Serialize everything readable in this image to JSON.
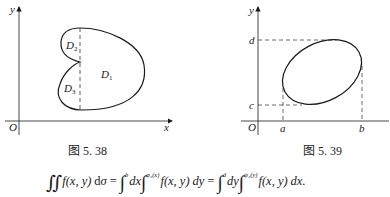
{
  "figures": [
    {
      "id": "fig-5-38",
      "caption": "图 5. 38",
      "axes": {
        "x_label": "x",
        "y_label": "y",
        "origin_label": "O"
      },
      "regions": [
        {
          "label": "D",
          "sub": "1"
        },
        {
          "label": "D",
          "sub": "2"
        },
        {
          "label": "D",
          "sub": "3"
        }
      ]
    },
    {
      "id": "fig-5-39",
      "caption": "图 5. 39",
      "axes": {
        "x_label": "x",
        "y_label": "y",
        "origin_label": "O"
      },
      "ticks": {
        "x": [
          "a",
          "b"
        ],
        "y": [
          "c",
          "d"
        ]
      }
    }
  ],
  "formula": {
    "lhs": "∬ f(x, y) dσ",
    "parts": {
      "dint": "∬",
      "f1": "f",
      "args1": "(x, y)",
      "d": "d",
      "sigma": "σ",
      "eq1": "=",
      "int1": "∫",
      "int1_upper": "b",
      "dx1": "dx",
      "int2": "∫",
      "int2_upper": "φ₂(x)",
      "f2": "f",
      "args2": "(x, y)",
      "dy1": "dy",
      "eq2": "=",
      "int3": "∫",
      "int3_upper": "d",
      "dy2": "dy",
      "int4": "∫",
      "int4_upper": "ψ₂(y)",
      "f3": "f",
      "args3": "(x, y)",
      "dx2": "dx."
    }
  }
}
